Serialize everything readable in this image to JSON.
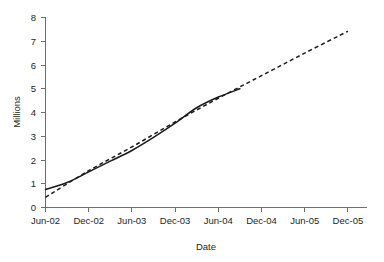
{
  "chart_data": {
    "type": "line",
    "title": "",
    "xlabel": "Date",
    "ylabel": "Millions",
    "grid": false,
    "legend": "none",
    "ylim": [
      0,
      8
    ],
    "yticks": [
      "0",
      "1",
      "2",
      "3",
      "4",
      "5",
      "6",
      "7",
      "8"
    ],
    "categories": [
      "Jun-02",
      "Dec-02",
      "Jun-03",
      "Dec-03",
      "Jun-04",
      "Dec-04",
      "Jun-05",
      "Dec-05"
    ],
    "xlim": [
      "Jun-02",
      "Dec-05"
    ],
    "series": [
      {
        "name": "actual",
        "style": "solid",
        "color": "#1a1a1a",
        "x": [
          "Jun-02",
          "Sep-02",
          "Dec-02",
          "Mar-03",
          "Jun-03",
          "Sep-03",
          "Dec-03",
          "Mar-04",
          "Jun-04",
          "Sep-04"
        ],
        "values": [
          0.76,
          1.05,
          1.5,
          1.95,
          2.4,
          2.95,
          3.55,
          4.2,
          4.65,
          5.0
        ]
      },
      {
        "name": "trend",
        "style": "dashed",
        "color": "#1a1a1a",
        "x": [
          "Jun-02",
          "Dec-02",
          "Jun-03",
          "Dec-03",
          "Jun-04",
          "Dec-04",
          "Jun-05",
          "Dec-05"
        ],
        "values": [
          0.43,
          1.55,
          2.55,
          3.6,
          4.6,
          5.55,
          6.5,
          7.42
        ]
      }
    ]
  },
  "axes": {
    "y_title": "Millions",
    "x_title": "Date"
  }
}
